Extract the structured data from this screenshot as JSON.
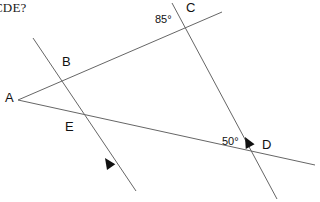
{
  "page": {
    "question_fragment": "CDE?",
    "background_color": "#ffffff",
    "line_color": "#666666",
    "text_color": "#111111"
  },
  "figure": {
    "type": "geometry-diagram",
    "points": [
      {
        "id": "A",
        "label": "A",
        "x": 18,
        "y": 100
      },
      {
        "id": "B",
        "label": "B",
        "x": 57,
        "y": 82
      },
      {
        "id": "C",
        "label": "C",
        "x": 186,
        "y": 22
      },
      {
        "id": "D",
        "label": "D",
        "x": 257,
        "y": 147
      },
      {
        "id": "E",
        "label": "E",
        "x": 77,
        "y": 112
      }
    ],
    "segments": [
      {
        "id": "ray-A-to-C",
        "name": "ray-a-b-c",
        "x1": 18,
        "y1": 100,
        "x2": 222,
        "y2": 12
      },
      {
        "id": "ray-A-to-D",
        "name": "ray-a-e-d",
        "x1": 18,
        "y1": 100,
        "x2": 315,
        "y2": 165
      },
      {
        "id": "parallel-1",
        "name": "line-through-b-e",
        "x1": 33,
        "y1": 38,
        "x2": 136,
        "y2": 191
      },
      {
        "id": "parallel-2",
        "name": "line-through-c-d",
        "x1": 172,
        "y1": 3,
        "x2": 277,
        "y2": 199
      }
    ],
    "arrow_marks": [
      {
        "id": "arrow-on-be",
        "name": "parallel-arrow-be",
        "x": 109,
        "y": 161,
        "angle": 56
      },
      {
        "id": "arrow-on-cd",
        "name": "parallel-arrow-cd",
        "x": 249,
        "y": 140,
        "angle": 62
      }
    ],
    "angles": [
      {
        "id": "angle-85",
        "label": "85°",
        "value": 85,
        "unit": "degrees",
        "at_point": "C"
      },
      {
        "id": "angle-50",
        "label": "50°",
        "value": 50,
        "unit": "degrees",
        "at_point": "D"
      }
    ]
  }
}
